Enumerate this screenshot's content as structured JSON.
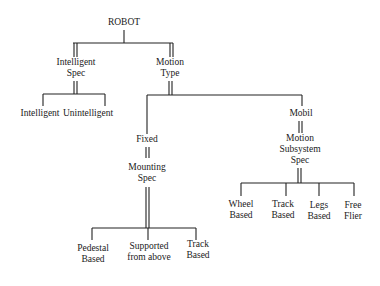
{
  "diagram": {
    "type": "tree",
    "root": "ROBOT",
    "nodes": {
      "robot": "ROBOT",
      "intelligent_spec": [
        "Intelligent",
        "Spec"
      ],
      "motion_type": [
        "Motion",
        "Type"
      ],
      "intelligent": "Intelligent",
      "unintelligent": "Unintelligent",
      "fixed": "Fixed",
      "mounting_spec": [
        "Mounting",
        "Spec"
      ],
      "pedestal_based": [
        "Pedestal",
        "Based"
      ],
      "supported_from_above": [
        "Supported",
        "from above"
      ],
      "track_based_fixed": [
        "Track",
        "Based"
      ],
      "mobil": "Mobil",
      "motion_subsystem_spec": [
        "Motion",
        "Subsystem",
        "Spec"
      ],
      "wheel_based": [
        "Wheel",
        "Based"
      ],
      "track_based_mobile": [
        "Track",
        "Based"
      ],
      "legs_based": [
        "Legs",
        "Based"
      ],
      "free_flier": [
        "Free",
        "Flier"
      ]
    },
    "edges": [
      {
        "from": "ROBOT",
        "to": "Intelligent Spec",
        "kind": "spec"
      },
      {
        "from": "ROBOT",
        "to": "Motion Type",
        "kind": "spec"
      },
      {
        "from": "Intelligent Spec",
        "to": "Intelligent",
        "kind": "choice"
      },
      {
        "from": "Intelligent Spec",
        "to": "Unintelligent",
        "kind": "choice"
      },
      {
        "from": "Motion Type",
        "to": "Fixed",
        "kind": "choice"
      },
      {
        "from": "Motion Type",
        "to": "Mobil",
        "kind": "choice"
      },
      {
        "from": "Fixed",
        "to": "Mounting Spec",
        "kind": "spec"
      },
      {
        "from": "Mounting Spec",
        "to": "Pedestal Based",
        "kind": "choice"
      },
      {
        "from": "Mounting Spec",
        "to": "Supported from above",
        "kind": "choice"
      },
      {
        "from": "Mounting Spec",
        "to": "Track Based",
        "kind": "choice"
      },
      {
        "from": "Mobil",
        "to": "Motion Subsystem Spec",
        "kind": "spec"
      },
      {
        "from": "Motion Subsystem Spec",
        "to": "Wheel Based",
        "kind": "choice"
      },
      {
        "from": "Motion Subsystem Spec",
        "to": "Track Based",
        "kind": "choice"
      },
      {
        "from": "Motion Subsystem Spec",
        "to": "Legs Based",
        "kind": "choice"
      },
      {
        "from": "Motion Subsystem Spec",
        "to": "Free Flier",
        "kind": "choice"
      }
    ],
    "colors": {
      "line": "#222222",
      "text": "#1a1a1a",
      "background": "#ffffff"
    }
  }
}
